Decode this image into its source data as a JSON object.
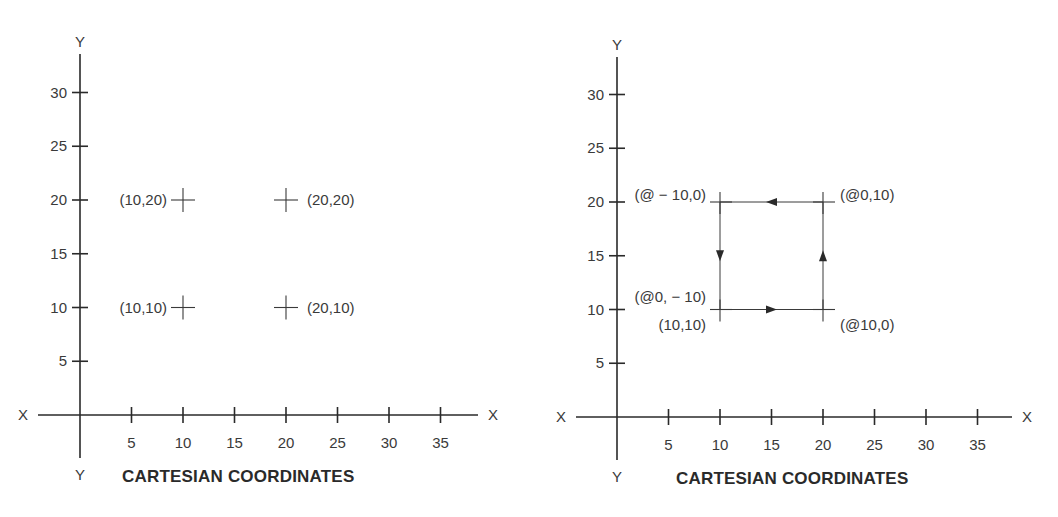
{
  "chart_data": [
    {
      "type": "scatter",
      "title": "CARTESIAN COORDINATES",
      "xlabel": "X",
      "ylabel": "Y",
      "xlim": [
        0,
        35
      ],
      "ylim": [
        0,
        30
      ],
      "grid": false,
      "x_ticks": [
        5,
        10,
        15,
        20,
        25,
        30,
        35
      ],
      "y_ticks": [
        5,
        10,
        15,
        20,
        25,
        30
      ],
      "points": [
        {
          "x": 10,
          "y": 20,
          "label": "(10,20)",
          "label_side": "left"
        },
        {
          "x": 20,
          "y": 20,
          "label": "(20,20)",
          "label_side": "right"
        },
        {
          "x": 10,
          "y": 10,
          "label": "(10,10)",
          "label_side": "left"
        },
        {
          "x": 20,
          "y": 10,
          "label": "(20,10)",
          "label_side": "right"
        }
      ]
    },
    {
      "type": "line",
      "title": "CARTESIAN COORDINATES",
      "xlabel": "X",
      "ylabel": "Y",
      "xlim": [
        0,
        35
      ],
      "ylim": [
        0,
        30
      ],
      "grid": false,
      "x_ticks": [
        5,
        10,
        15,
        20,
        25,
        30,
        35
      ],
      "y_ticks": [
        5,
        10,
        15,
        20,
        25,
        30
      ],
      "start_point": {
        "x": 10,
        "y": 10,
        "label": "(10,10)"
      },
      "path": [
        {
          "from": [
            10,
            10
          ],
          "to": [
            20,
            10
          ],
          "relative": "(@10,0)"
        },
        {
          "from": [
            20,
            10
          ],
          "to": [
            20,
            20
          ],
          "relative": "(@0,10)"
        },
        {
          "from": [
            20,
            20
          ],
          "to": [
            10,
            20
          ],
          "relative": "(@ − 10,0)"
        },
        {
          "from": [
            10,
            20
          ],
          "to": [
            10,
            10
          ],
          "relative": "(@0, − 10)"
        }
      ],
      "annotations": [
        {
          "text": "(@ − 10,0)",
          "at": [
            10,
            20
          ],
          "position": "left"
        },
        {
          "text": "(@0,10)",
          "at": [
            20,
            20
          ],
          "position": "right"
        },
        {
          "text": "(@0, − 10)",
          "at": [
            10,
            10
          ],
          "position": "upper-left"
        },
        {
          "text": "(10,10)",
          "at": [
            10,
            10
          ],
          "position": "lower-left"
        },
        {
          "text": "(@10,0)",
          "at": [
            20,
            10
          ],
          "position": "lower-right"
        }
      ]
    }
  ]
}
